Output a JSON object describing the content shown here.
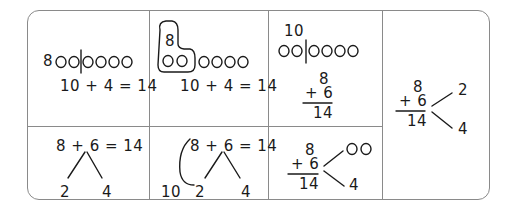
{
  "colors": {
    "ink": "#1a1a1a",
    "grid": "#8a8a8a",
    "background": "#ffffff"
  },
  "cells": [
    {
      "id": "top-1",
      "label_eight": "8",
      "circles_before_bar": 2,
      "circles_after_bar": 4,
      "equation": "10 + 4 = 14"
    },
    {
      "id": "top-2",
      "label_eight": "8",
      "circles_grouped": 2,
      "circles_after": 4,
      "equation": "10 + 4 = 14"
    },
    {
      "id": "top-3",
      "label_ten": "10",
      "circles_before_bar": 2,
      "circles_after_bar": 4,
      "vertical": {
        "top": "8",
        "addend": "+ 6",
        "sum": "14"
      }
    },
    {
      "id": "right-tall",
      "vertical": {
        "top": "8",
        "addend": "+ 6",
        "sum": "14"
      },
      "branch_top": "2",
      "branch_bottom": "4"
    },
    {
      "id": "bottom-1",
      "equation": "8 + 6 = 14",
      "branch_left": "2",
      "branch_right": "4"
    },
    {
      "id": "bottom-2",
      "equation": "8 + 6 = 14",
      "bracket_label": "10",
      "branch_left": "2",
      "branch_right": "4"
    },
    {
      "id": "bottom-3",
      "vertical": {
        "top": "8",
        "addend": "+ 6",
        "sum": "14"
      },
      "branch_top_circles": 2,
      "branch_bottom": "4"
    }
  ]
}
